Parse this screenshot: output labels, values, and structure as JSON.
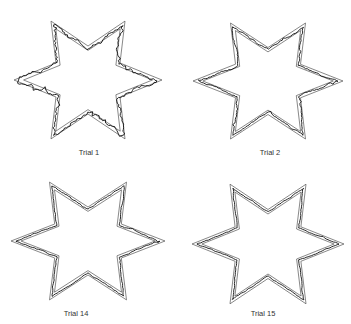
{
  "figure": {
    "colors": {
      "boundary": "#555555",
      "trace": "#111111",
      "background": "#ffffff"
    },
    "panels": [
      {
        "label": "Trial 1",
        "cx": 88,
        "cy": 80,
        "rx": 74,
        "ry": 68,
        "jitter": 3.2,
        "seed": 11,
        "label_x": 89,
        "label_y": 155
      },
      {
        "label": "Trial 2",
        "cx": 268,
        "cy": 81,
        "rx": 75,
        "ry": 67,
        "jitter": 1.4,
        "seed": 23,
        "label_x": 270,
        "label_y": 155
      },
      {
        "label": "Trial 14",
        "cx": 88,
        "cy": 241,
        "rx": 77,
        "ry": 68,
        "jitter": 0.9,
        "seed": 37,
        "label_x": 76,
        "label_y": 316
      },
      {
        "label": "Trial 15",
        "cx": 268,
        "cy": 244,
        "rx": 76,
        "ry": 69,
        "jitter": 0.8,
        "seed": 41,
        "label_x": 263,
        "label_y": 316
      }
    ]
  }
}
